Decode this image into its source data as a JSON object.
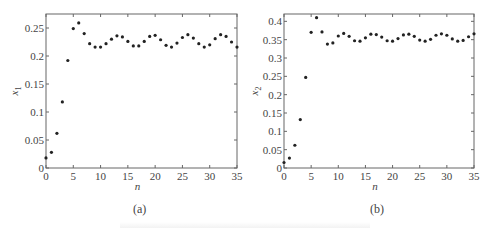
{
  "chart_data": [
    {
      "type": "scatter",
      "panel_label": "(a)",
      "title": "",
      "xlabel": "n",
      "ylabel": "x_1",
      "xlim": [
        0,
        35
      ],
      "ylim": [
        0,
        0.275
      ],
      "xticks": [
        0,
        5,
        10,
        15,
        20,
        25,
        30,
        35
      ],
      "xtick_labels": [
        "0",
        "5",
        "10",
        "15",
        "20",
        "25",
        "30",
        "35"
      ],
      "yticks": [
        0,
        0.05,
        0.1,
        0.15,
        0.2,
        0.25
      ],
      "ytick_labels": [
        "0",
        "0.05",
        "0.1",
        "0.15",
        "0.2",
        "0.25"
      ],
      "grid": false,
      "marker": "*",
      "color": "#222222",
      "x": [
        0,
        1,
        2,
        3,
        4,
        5,
        6,
        7,
        8,
        9,
        10,
        11,
        12,
        13,
        14,
        15,
        16,
        17,
        18,
        19,
        20,
        21,
        22,
        23,
        24,
        25,
        26,
        27,
        28,
        29,
        30,
        31,
        32,
        33,
        34,
        35
      ],
      "y": [
        0.018,
        0.028,
        0.062,
        0.118,
        0.192,
        0.249,
        0.259,
        0.24,
        0.222,
        0.216,
        0.216,
        0.222,
        0.23,
        0.236,
        0.234,
        0.226,
        0.218,
        0.218,
        0.226,
        0.235,
        0.237,
        0.229,
        0.219,
        0.216,
        0.223,
        0.233,
        0.238,
        0.232,
        0.222,
        0.216,
        0.22,
        0.231,
        0.238,
        0.235,
        0.225,
        0.216
      ]
    },
    {
      "type": "scatter",
      "panel_label": "(b)",
      "title": "",
      "xlabel": "n",
      "ylabel": "x_2",
      "xlim": [
        0,
        35
      ],
      "ylim": [
        0,
        0.42
      ],
      "xticks": [
        0,
        5,
        10,
        15,
        20,
        25,
        30,
        35
      ],
      "xtick_labels": [
        "0",
        "5",
        "10",
        "15",
        "20",
        "25",
        "30",
        "35"
      ],
      "yticks": [
        0,
        0.05,
        0.1,
        0.15,
        0.2,
        0.25,
        0.3,
        0.35,
        0.4
      ],
      "ytick_labels": [
        "0",
        "0.05",
        "0.1",
        "0.15",
        "0.2",
        "0.25",
        "0.3",
        "0.35",
        "0.4"
      ],
      "grid": false,
      "marker": "*",
      "color": "#222222",
      "x": [
        0,
        1,
        2,
        3,
        4,
        5,
        6,
        7,
        8,
        9,
        10,
        11,
        12,
        13,
        14,
        15,
        16,
        17,
        18,
        19,
        20,
        21,
        22,
        23,
        24,
        25,
        26,
        27,
        28,
        29,
        30,
        31,
        32,
        33,
        34,
        35
      ],
      "y": [
        0.015,
        0.027,
        0.062,
        0.132,
        0.247,
        0.37,
        0.41,
        0.371,
        0.338,
        0.341,
        0.36,
        0.367,
        0.359,
        0.347,
        0.346,
        0.355,
        0.365,
        0.364,
        0.357,
        0.347,
        0.346,
        0.353,
        0.363,
        0.365,
        0.359,
        0.349,
        0.346,
        0.351,
        0.362,
        0.366,
        0.362,
        0.352,
        0.346,
        0.348,
        0.358,
        0.366
      ]
    }
  ],
  "panels": {
    "a": {
      "label": "(a)",
      "xlabel": "n",
      "ylabel_base": "x",
      "ylabel_sub": "1"
    },
    "b": {
      "label": "(b)",
      "xlabel": "n",
      "ylabel_base": "x",
      "ylabel_sub": "2"
    }
  }
}
